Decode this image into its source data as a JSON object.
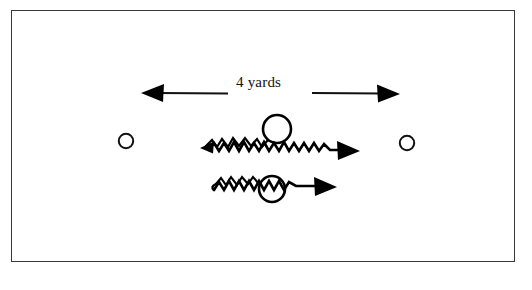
{
  "diagram": {
    "title": "4 yards",
    "type": "sports-drill-diagram",
    "background_color": "#ffffff",
    "ink_color": "#000000",
    "frame": {
      "name": "diagram-border",
      "border_color": "#3a3a3a",
      "x": 11,
      "y": 10,
      "width": 504,
      "height": 252
    },
    "measurement": {
      "label": "4 yards",
      "units": "yards",
      "value": 4,
      "left_arrow": {
        "name": "measure-arrow-left",
        "direction": "left",
        "tail_x": 228,
        "tip_x": 140,
        "y": 93
      },
      "right_arrow": {
        "name": "measure-arrow-right",
        "direction": "right",
        "tail_x": 312,
        "tip_x": 400,
        "y": 93
      }
    },
    "cones": [
      {
        "name": "cone-left",
        "cx": 126,
        "cy": 141,
        "r": 7.5,
        "filled": false
      },
      {
        "name": "cone-right",
        "cx": 407,
        "cy": 143,
        "r": 7.5,
        "filled": false
      }
    ],
    "players": [
      {
        "name": "player-top",
        "cx": 277,
        "cy": 129,
        "r": 14,
        "filled": false,
        "route": {
          "name": "route-top",
          "style": "zigzag",
          "start_arrow": "left",
          "end_arrow": "right",
          "start_x": 203,
          "end_x": 360,
          "y": 150,
          "amplitude": 6,
          "period": 9
        }
      },
      {
        "name": "player-bottom",
        "cx": 272,
        "cy": 189,
        "r": 13,
        "filled": false,
        "route": {
          "name": "route-bottom",
          "style": "zigzag",
          "start_arrow": "none",
          "end_arrow": "right",
          "start_x": 213,
          "end_x": 337,
          "y": 187,
          "amplitude": 6,
          "period": 9
        }
      }
    ]
  }
}
